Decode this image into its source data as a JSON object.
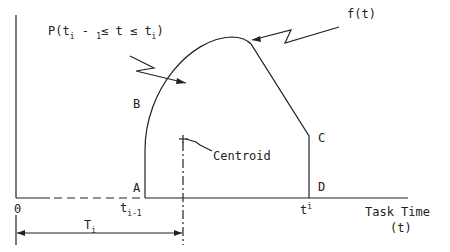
{
  "diagram": {
    "labels": {
      "prob": "P(t",
      "prob_sub1": "i",
      "prob_mid": " - ",
      "prob_sub2": "1",
      "prob_rest": "≤ t ≤ t",
      "prob_sub3": "i",
      "prob_close": ")",
      "ft": "f(t)",
      "B": "B",
      "A": "A",
      "C": "C",
      "D": "D",
      "centroid": "Centroid",
      "origin": "0",
      "t_prev": "t",
      "t_prev_sub": "i-1",
      "t_i": "t",
      "t_i_sup": "i",
      "T_i": "T",
      "T_i_sub": "i",
      "xaxis_1": "Task Time",
      "xaxis_2": "(t)"
    },
    "colors": {
      "line": "#222222",
      "background": "#ffffff"
    }
  }
}
